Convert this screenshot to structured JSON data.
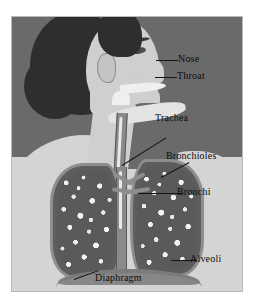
{
  "figure": {
    "type": "labeled anatomical diagram",
    "style": "grayscale halftone illustration on a light plate with a thin border"
  },
  "palette": {
    "background_upper": "#6a6a6a",
    "background_lower": "#d4d4d4",
    "skin": "#cfcfcf",
    "hair": "#2e2e2e",
    "lung_fill": "#5d5d5d",
    "lung_outline": "#8e8e8e",
    "airway": "#8a8a8a",
    "alveoli_speckle": "#f2f2f2",
    "label_text": "#0d0d0d",
    "leader_line": "#151515",
    "plate_border": "#b9b9b9"
  },
  "labels": [
    {
      "id": "nose",
      "text": "Nose"
    },
    {
      "id": "throat",
      "text": "Throat"
    },
    {
      "id": "trachea",
      "text": "Trachea"
    },
    {
      "id": "bronchioles",
      "text": "Bronchioles"
    },
    {
      "id": "bronchi",
      "text": "Bronchi"
    },
    {
      "id": "alveoli",
      "text": "Alveoli"
    },
    {
      "id": "diaphragm",
      "text": "Diaphragm"
    }
  ]
}
